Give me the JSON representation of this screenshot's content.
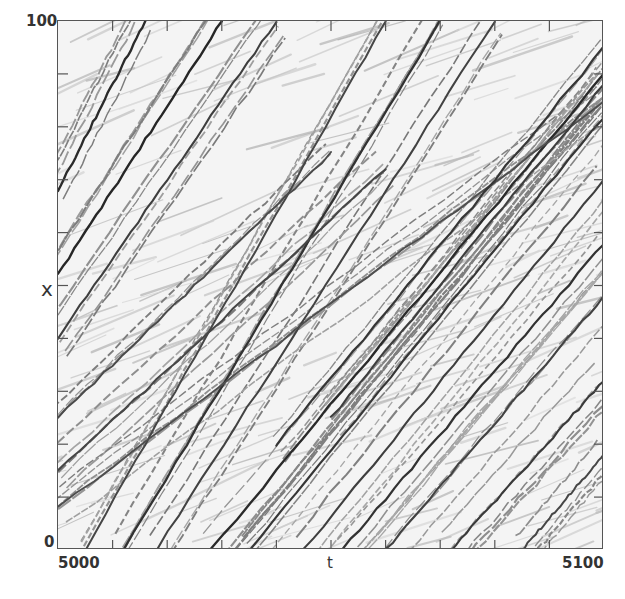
{
  "chart_data": {
    "type": "heatmap",
    "subtype": "space-time diagram (grayscale streak pattern)",
    "title": "",
    "xlabel": "t",
    "ylabel": "x",
    "xlim": [
      5000,
      5100
    ],
    "ylim": [
      0,
      100
    ],
    "x_tick_labels": [
      "5000",
      "5100"
    ],
    "y_tick_labels": [
      "0",
      "100"
    ],
    "x_minor_ticks": [
      5010,
      5020,
      5030,
      5040,
      5050,
      5060,
      5070,
      5080,
      5090
    ],
    "y_minor_ticks": [
      10,
      20,
      30,
      40,
      50,
      60,
      70,
      80,
      90
    ],
    "grid": false,
    "legend": null,
    "colormap": "grayscale (white background, dark streaks)",
    "streaks": [
      {
        "t0": 5000,
        "x0": 68,
        "t1": 5016,
        "x1": 100,
        "shade": 0.85
      },
      {
        "t0": 5000,
        "x0": 52,
        "t1": 5030,
        "x1": 100,
        "shade": 0.9
      },
      {
        "t0": 5000,
        "x0": 40,
        "t1": 5040,
        "x1": 100,
        "shade": 0.6
      },
      {
        "t0": 5005,
        "x0": 0,
        "t1": 5060,
        "x1": 100,
        "shade": 0.5
      },
      {
        "t0": 5012,
        "x0": 0,
        "t1": 5070,
        "x1": 100,
        "shade": 0.75
      },
      {
        "t0": 5018,
        "x0": 0,
        "t1": 5080,
        "x1": 100,
        "shade": 0.55
      },
      {
        "t0": 5028,
        "x0": 0,
        "t1": 5100,
        "x1": 90,
        "shade": 0.85
      },
      {
        "t0": 5035,
        "x0": 0,
        "t1": 5100,
        "x1": 82,
        "shade": 0.7
      },
      {
        "t0": 5045,
        "x0": 0,
        "t1": 5100,
        "x1": 70,
        "shade": 0.6
      },
      {
        "t0": 5052,
        "x0": 0,
        "t1": 5100,
        "x1": 58,
        "shade": 0.75
      },
      {
        "t0": 5060,
        "x0": 0,
        "t1": 5100,
        "x1": 48,
        "shade": 0.55
      },
      {
        "t0": 5072,
        "x0": 0,
        "t1": 5100,
        "x1": 32,
        "shade": 0.65
      },
      {
        "t0": 5085,
        "x0": 0,
        "t1": 5100,
        "x1": 18,
        "shade": 0.5
      },
      {
        "t0": 5000,
        "x0": 25,
        "t1": 5050,
        "x1": 75,
        "shade": 0.45
      },
      {
        "t0": 5000,
        "x0": 15,
        "t1": 5060,
        "x1": 72,
        "shade": 0.5
      },
      {
        "t0": 5000,
        "x0": 8,
        "t1": 5100,
        "x1": 85,
        "shade": 0.4
      },
      {
        "t0": 5040,
        "x0": 20,
        "t1": 5100,
        "x1": 95,
        "shade": 0.7
      },
      {
        "t0": 5050,
        "x0": 25,
        "t1": 5100,
        "x1": 88,
        "shade": 0.6
      }
    ]
  },
  "axes": {
    "x_label": "t",
    "y_label": "x",
    "x_min_label": "5000",
    "x_max_label": "5100",
    "y_min_label": "0",
    "y_max_label": "100"
  }
}
